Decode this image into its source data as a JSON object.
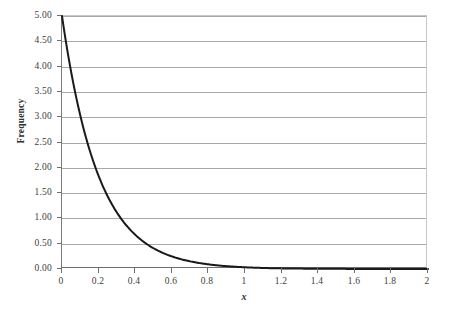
{
  "chart_data": {
    "type": "line",
    "title": "",
    "subtitle": "",
    "xlabel": "x",
    "ylabel": "Frequency",
    "xlim": [
      0,
      2
    ],
    "ylim": [
      0,
      5
    ],
    "grid": "horizontal",
    "legend": "none",
    "series": [
      {
        "name": "exponential density",
        "formula": "f(x) = 5 * exp(-5x)",
        "color": "#1a1a1a",
        "line_width": 2,
        "x": [
          0,
          0.05,
          0.1,
          0.15,
          0.2,
          0.25,
          0.3,
          0.35,
          0.4,
          0.45,
          0.5,
          0.55,
          0.6,
          0.65,
          0.7,
          0.75,
          0.8,
          0.85,
          0.9,
          0.95,
          1.0,
          1.1,
          1.2,
          1.3,
          1.4,
          1.5,
          1.6,
          1.7,
          1.8,
          1.9,
          2.0
        ],
        "values": [
          5.0,
          3.894,
          3.033,
          2.362,
          1.839,
          1.433,
          1.116,
          0.869,
          0.677,
          0.527,
          0.41,
          0.32,
          0.249,
          0.194,
          0.151,
          0.118,
          0.092,
          0.071,
          0.056,
          0.043,
          0.034,
          0.02,
          0.012,
          0.008,
          0.005,
          0.003,
          0.002,
          0.001,
          0.001,
          0.0,
          0.0
        ]
      }
    ],
    "x_ticks": [
      {
        "value": 0,
        "label": "0"
      },
      {
        "value": 0.2,
        "label": "0.2"
      },
      {
        "value": 0.4,
        "label": "0.4"
      },
      {
        "value": 0.6,
        "label": "0.6"
      },
      {
        "value": 0.8,
        "label": "0.8"
      },
      {
        "value": 1.0,
        "label": "1"
      },
      {
        "value": 1.2,
        "label": "1.2"
      },
      {
        "value": 1.4,
        "label": "1.4"
      },
      {
        "value": 1.6,
        "label": "1.6"
      },
      {
        "value": 1.8,
        "label": "1.8"
      },
      {
        "value": 2.0,
        "label": "2"
      }
    ],
    "y_ticks": [
      {
        "value": 5.0,
        "label": "5.00"
      },
      {
        "value": 4.5,
        "label": "4.50"
      },
      {
        "value": 4.0,
        "label": "4.00"
      },
      {
        "value": 3.5,
        "label": "3.50"
      },
      {
        "value": 3.0,
        "label": "3.00"
      },
      {
        "value": 2.5,
        "label": "2.50"
      },
      {
        "value": 2.0,
        "label": "2.00"
      },
      {
        "value": 1.5,
        "label": "1.50"
      },
      {
        "value": 1.0,
        "label": "1.00"
      },
      {
        "value": 0.5,
        "label": "0.50"
      },
      {
        "value": 0.0,
        "label": "0.00"
      }
    ],
    "colors": {
      "curve": "#1a1a1a",
      "gridline": "#a9a9a9",
      "axis": "#6e6e6e",
      "plot_border": "#c8c8c8",
      "background": "#ffffff",
      "text": "#3d3d3d"
    }
  }
}
